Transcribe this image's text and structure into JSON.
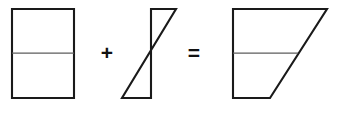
{
  "figure": {
    "canvas": {
      "width": 337,
      "height": 117,
      "background": "#ffffff"
    },
    "colors": {
      "outline": "#1a1a1a",
      "divider": "#5c5c5c",
      "fill": "#ffffff",
      "operator": "#111111"
    },
    "stroke_widths": {
      "outline": 2.1,
      "divider": 1.25
    },
    "operators": [
      {
        "name": "plus",
        "symbol": "+",
        "x": 107,
        "y": 54
      },
      {
        "name": "equals",
        "symbol": "=",
        "x": 194,
        "y": 54
      }
    ],
    "shapes": [
      {
        "name": "rectangle",
        "role": "first-operand",
        "kind": "rectangle",
        "points": "12,9 74,9 74,98 12,98",
        "divider": {
          "x1": 12,
          "y1": 53,
          "x2": 74,
          "y2": 53
        },
        "bbox": {
          "x": 12,
          "y": 9,
          "width": 62,
          "height": 89
        }
      },
      {
        "name": "z-shape",
        "role": "second-operand",
        "kind": "quadrilateral",
        "points": "151,9 176,9 122,98 151,98",
        "divider": null,
        "bbox": {
          "x": 122,
          "y": 9,
          "width": 54,
          "height": 89
        }
      },
      {
        "name": "trapezoid",
        "role": "result",
        "kind": "trapezoid",
        "points": "233,9 327,9 270,98 233,98",
        "divider": {
          "x1": 233,
          "y1": 53,
          "x2": 298,
          "y2": 53
        },
        "bbox": {
          "x": 233,
          "y": 9,
          "width": 94,
          "height": 89
        }
      }
    ]
  }
}
